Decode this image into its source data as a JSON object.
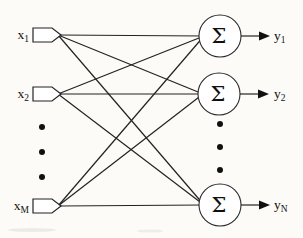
{
  "figure": {
    "node_symbol": "Σ",
    "inputs": [
      {
        "base": "x",
        "sub": "1"
      },
      {
        "base": "x",
        "sub": "2"
      },
      {
        "base": "x",
        "sub": "M"
      }
    ],
    "outputs": [
      {
        "base": "y",
        "sub": "1"
      },
      {
        "base": "y",
        "sub": "2"
      },
      {
        "base": "y",
        "sub": "N"
      }
    ],
    "ellipsis_icon": "vertical-dots",
    "colors": {
      "background": "#fcfbf8",
      "stroke": "#232323",
      "node_fill": "#ffffff",
      "text": "#101010"
    }
  }
}
